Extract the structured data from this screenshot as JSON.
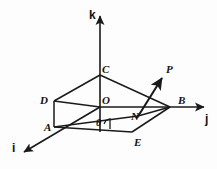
{
  "figure": {
    "background_color": "#fdfdfd",
    "stroke_color": "#1a1a1a"
  },
  "axes": [
    {
      "key": "k",
      "label": "k",
      "name": "axis-label-k",
      "orientation": "vertical-up",
      "label_x": 89,
      "label_y": 9
    },
    {
      "key": "j",
      "label": "j",
      "name": "axis-label-j",
      "orientation": "right",
      "label_x": 205,
      "label_y": 113
    },
    {
      "key": "i",
      "label": "i",
      "name": "axis-label-i",
      "orientation": "lower-left",
      "label_x": 12,
      "label_y": 142
    }
  ],
  "vertices": [
    {
      "key": "C",
      "label": "C",
      "name": "vertex-label-c",
      "label_x": 102,
      "label_y": 64,
      "point_x": 100,
      "point_y": 75
    },
    {
      "key": "P",
      "label": "P",
      "name": "vertex-label-p",
      "label_x": 166,
      "label_y": 64,
      "point_x": 163,
      "point_y": 76
    },
    {
      "key": "D",
      "label": "D",
      "name": "vertex-label-d",
      "label_x": 40,
      "label_y": 95,
      "point_x": 54,
      "point_y": 101
    },
    {
      "key": "O",
      "label": "O",
      "name": "vertex-label-o",
      "label_x": 102,
      "label_y": 95,
      "point_x": 100,
      "point_y": 107
    },
    {
      "key": "B",
      "label": "B",
      "name": "vertex-label-b",
      "label_x": 178,
      "label_y": 95,
      "point_x": 170,
      "point_y": 107
    },
    {
      "key": "N",
      "label": "N",
      "name": "vertex-label-n",
      "label_x": 131,
      "label_y": 111,
      "point_x": 138,
      "point_y": 116
    },
    {
      "key": "A",
      "label": "A",
      "name": "vertex-label-a",
      "label_x": 44,
      "label_y": 122,
      "point_x": 54,
      "point_y": 127
    },
    {
      "key": "E",
      "label": "E",
      "name": "vertex-label-e",
      "label_x": 134,
      "label_y": 137,
      "point_x": 132,
      "point_y": 132
    }
  ],
  "angle": {
    "key": "theta",
    "label": "θ",
    "name": "angle-label-theta",
    "label_x": 96,
    "label_y": 118
  }
}
